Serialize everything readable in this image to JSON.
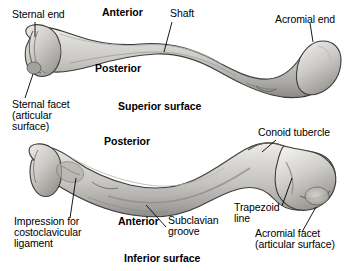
{
  "figure": {
    "background_color": "#ffffff",
    "bone_fill_color": "#c9c7c3",
    "bone_outline_color": "#3a3a3a",
    "text_color": "#000000",
    "width": 350,
    "height": 271
  },
  "views": {
    "superior": {
      "caption": "Superior surface",
      "orientation_top": "Anterior",
      "orientation_bottom": "Posterior"
    },
    "inferior": {
      "caption": "Inferior surface",
      "orientation_top": "Posterior",
      "orientation_bottom": "Anterior"
    }
  },
  "labels": {
    "sternal_end": "Sternal end",
    "shaft": "Shaft",
    "acromial_end": "Acromial end",
    "sternal_facet_1": "Sternal facet",
    "sternal_facet_2": "(articular",
    "sternal_facet_3": "surface)",
    "anterior_top": "Anterior",
    "posterior_top": "Posterior",
    "superior_surface": "Superior surface",
    "conoid_tubercle": "Conoid tubercle",
    "posterior_bottom": "Posterior",
    "anterior_bottom": "Anterior",
    "impression_1": "Impression for",
    "impression_2": "costoclavicular",
    "impression_3": "ligament",
    "subclavian_1": "Subclavian",
    "subclavian_2": "groove",
    "trapezoid_1": "Trapezoid",
    "trapezoid_2": "line",
    "acromial_facet_1": "Acromial facet",
    "acromial_facet_2": "(articular surface)",
    "inferior_surface": "Inferior surface"
  }
}
